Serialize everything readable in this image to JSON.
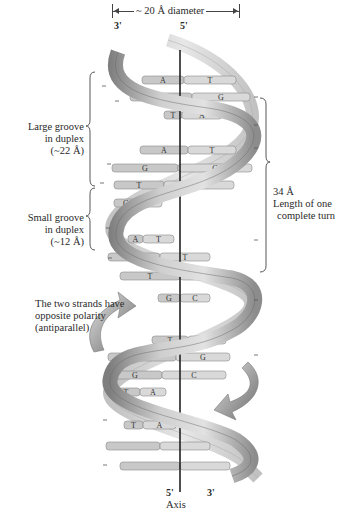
{
  "diagram": {
    "diameter_label": "~ 20 Å diameter",
    "strand_ends": {
      "top_left": "3'",
      "top_right": "5'",
      "bottom_left": "5'",
      "bottom_right": "3'"
    },
    "axis_label": "Axis",
    "large_groove": {
      "line1": "Large groove",
      "line2": "in duplex",
      "line3": "(~22 Å)"
    },
    "small_groove": {
      "line1": "Small groove",
      "line2": "in duplex",
      "line3": "(~12 Å)"
    },
    "turn_length": {
      "line1": "34 Å",
      "line2": "Length of one",
      "line3": "complete turn"
    },
    "polarity_note": {
      "line1": "The two strands have",
      "line2": "opposite polarity",
      "line3": "(antiparallel)"
    },
    "colors": {
      "strand_light": "#d8d8d8",
      "strand_dark": "#8a8a8a",
      "base_left": "#c8c8c8",
      "base_right": "#d9d9d9",
      "axis": "#222222",
      "arrow": "#9a9a9a"
    },
    "base_pairs": [
      {
        "y": 80,
        "x1": 142,
        "x2": 236,
        "split": 184,
        "left": "A",
        "right": "T"
      },
      {
        "y": 97,
        "x1": 130,
        "x2": 250,
        "split": 192,
        "left": "C",
        "right": "G"
      },
      {
        "y": 115,
        "x1": 164,
        "x2": 222,
        "split": 182,
        "left": "T",
        "right": "A"
      },
      {
        "y": 150,
        "x1": 140,
        "x2": 236,
        "split": 188,
        "left": "A",
        "right": "T"
      },
      {
        "y": 168,
        "x1": 112,
        "x2": 252,
        "split": 178,
        "left": "G",
        "right": "C"
      },
      {
        "y": 185,
        "x1": 114,
        "x2": 234,
        "split": 164,
        "left": "T",
        "right": "A"
      },
      {
        "y": 203,
        "x1": 114,
        "x2": 162,
        "split": 138,
        "left": "G",
        "right": "C"
      },
      {
        "y": 239,
        "x1": 128,
        "x2": 174,
        "split": 143,
        "left": "A",
        "right": "T"
      },
      {
        "y": 257,
        "x1": 108,
        "x2": 210,
        "split": 160,
        "left": "A",
        "right": "T"
      },
      {
        "y": 276,
        "x1": 120,
        "x2": 232,
        "split": 180,
        "left": "T",
        "right": "A"
      },
      {
        "y": 298,
        "x1": 158,
        "x2": 210,
        "split": 180,
        "left": "G",
        "right": "C"
      },
      {
        "y": 340,
        "x1": 152,
        "x2": 226,
        "split": 188,
        "left": "T",
        "right": "A"
      },
      {
        "y": 357,
        "x1": 108,
        "x2": 230,
        "split": 176,
        "left": "C",
        "right": "G"
      },
      {
        "y": 375,
        "x1": 108,
        "x2": 226,
        "split": 162,
        "left": "G",
        "right": "C"
      },
      {
        "y": 392,
        "x1": 112,
        "x2": 166,
        "split": 140,
        "left": "T",
        "right": "A"
      },
      {
        "y": 425,
        "x1": 124,
        "x2": 176,
        "split": 143,
        "left": "T",
        "right": "A"
      },
      {
        "y": 446,
        "x1": 106,
        "x2": 210,
        "split": 160,
        "left": "",
        "right": ""
      },
      {
        "y": 466,
        "x1": 120,
        "x2": 230,
        "split": 180,
        "left": "",
        "right": ""
      }
    ]
  }
}
